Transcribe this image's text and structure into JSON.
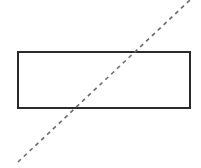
{
  "diagram": {
    "background": "#ffffff",
    "rectangle": {
      "x": 18,
      "y": 52,
      "width": 172,
      "height": 56,
      "stroke": "#2a2a2a",
      "stroke_width": 2,
      "fill": "#ffffff"
    },
    "dashed_line": {
      "x1": 18,
      "y1": 162,
      "x2": 190,
      "y2": 0,
      "stroke": "#6a6a6a",
      "stroke_width": 1.6,
      "dasharray": "4,4"
    }
  }
}
